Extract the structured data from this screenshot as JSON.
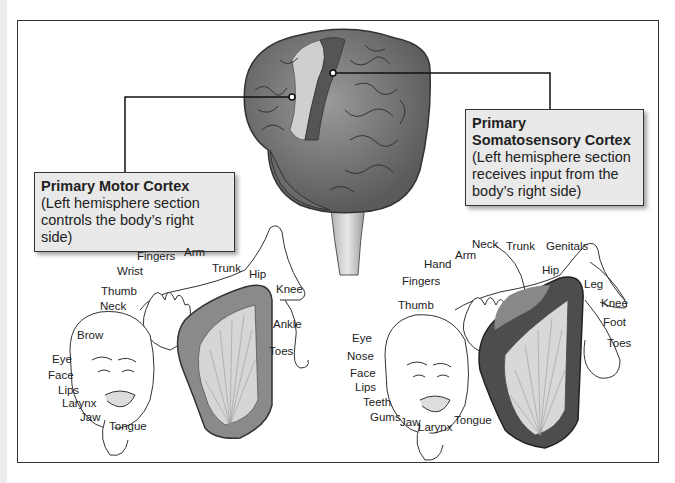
{
  "diagram": {
    "type": "anatomy-homunculus",
    "callouts": {
      "motor": {
        "title": "Primary Motor Cortex",
        "description": "(Left hemisphere section controls the body’s right side)",
        "line1": "(Left hemisphere section",
        "line2": "controls the body’s right side)"
      },
      "sensory": {
        "title_line1": "Primary",
        "title_line2": "Somatosensory Cortex",
        "line1": "(Left hemisphere section",
        "line2": "receives input from the",
        "line3": "body’s right side)"
      }
    },
    "motor_homunculus_labels": [
      "Fingers",
      "Arm",
      "Wrist",
      "Trunk",
      "Hip",
      "Thumb",
      "Knee",
      "Neck",
      "Brow",
      "Ankle",
      "Toes",
      "Eye",
      "Face",
      "Lips",
      "Larynx",
      "Jaw",
      "Tongue"
    ],
    "sensory_homunculus_labels": [
      "Neck",
      "Trunk",
      "Genitals",
      "Hand",
      "Arm",
      "Hip",
      "Fingers",
      "Leg",
      "Thumb",
      "Knee",
      "Foot",
      "Toes",
      "Eye",
      "Nose",
      "Face",
      "Lips",
      "Teeth",
      "Gums",
      "Jaw",
      "Larynx",
      "Tongue"
    ],
    "colors": {
      "frame": "#333333",
      "callout_bg": "#e9e9e9",
      "brain_gray": "#7a7a7a",
      "motor_strip": "#c8c8c8",
      "sensory_strip": "#4a4a4a"
    }
  }
}
